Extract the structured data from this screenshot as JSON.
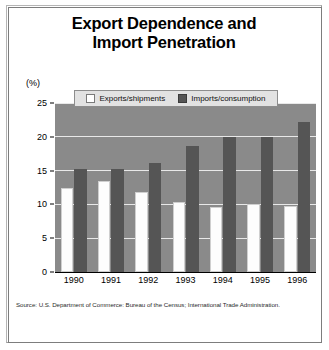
{
  "title": {
    "line1": "Export Dependence and",
    "line2": "Import Penetration"
  },
  "axis": {
    "unit_label": "(%)"
  },
  "legend": {
    "exports_label": "Exports/shipments",
    "imports_label": "Imports/consumption"
  },
  "source": "Source: U.S. Department of Commerce: Bureau of the Census; International Trade Administration.",
  "colors": {
    "plot_background": "#8a8a8a",
    "gridline": "#e8e8e8",
    "exports_bar": "#fdfdfd",
    "imports_bar": "#555555",
    "legend_background": "#e2e2e2",
    "frame_border": "#7d7d7d",
    "text": "#000000"
  },
  "chart_data": {
    "type": "bar",
    "title": "Export Dependence and Import Penetration",
    "xlabel": "",
    "ylabel": "(%)",
    "ylim": [
      0,
      25
    ],
    "yticks": [
      0,
      5,
      10,
      15,
      20,
      25
    ],
    "grid": true,
    "legend_position": "top-center",
    "categories": [
      "1990",
      "1991",
      "1992",
      "1993",
      "1994",
      "1995",
      "1996"
    ],
    "series": [
      {
        "name": "Exports/shipments",
        "color": "#fdfdfd",
        "values": [
          12.5,
          13.4,
          11.8,
          10.4,
          9.6,
          10.0,
          9.8
        ]
      },
      {
        "name": "Imports/consumption",
        "color": "#555555",
        "values": [
          15.2,
          15.3,
          16.2,
          18.6,
          20.0,
          20.0,
          22.2
        ]
      }
    ]
  }
}
